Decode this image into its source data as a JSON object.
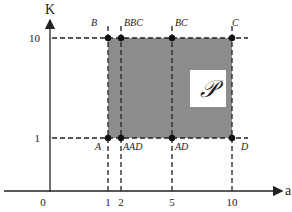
{
  "diagram": {
    "axes": {
      "y_label": "K",
      "x_label": "a",
      "origin_label": "0",
      "x_ticks": [
        "1",
        "2",
        "5",
        "10"
      ],
      "y_ticks": [
        "10",
        "1"
      ]
    },
    "region": {
      "label": "𝒫",
      "fill_color": "#8c8c8c",
      "x_range": [
        1,
        10
      ],
      "y_range": [
        1,
        10
      ]
    },
    "points": [
      {
        "name": "A",
        "a": 1,
        "K": 1
      },
      {
        "name": "AAD",
        "a": 2,
        "K": 1
      },
      {
        "name": "AD",
        "a": 5,
        "K": 1
      },
      {
        "name": "D",
        "a": 10,
        "K": 1
      },
      {
        "name": "B",
        "a": 1,
        "K": 10
      },
      {
        "name": "BBC",
        "a": 2,
        "K": 10
      },
      {
        "name": "BC",
        "a": 5,
        "K": 10
      },
      {
        "name": "C",
        "a": 10,
        "K": 10
      }
    ]
  }
}
